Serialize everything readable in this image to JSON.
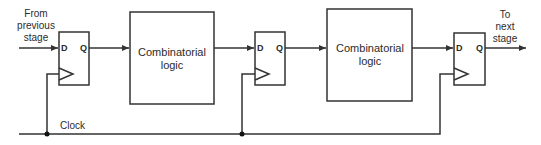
{
  "diagram": {
    "colors": {
      "stroke": "#333333",
      "text": "#2b2b2b",
      "background": "#ffffff"
    },
    "input_label": [
      "From",
      "previous",
      "stage"
    ],
    "output_label": [
      "To",
      "next",
      "stage"
    ],
    "clock_label": "Clock",
    "flip_flops": [
      {
        "id": "ff1",
        "d_label": "D",
        "q_label": "Q"
      },
      {
        "id": "ff2",
        "d_label": "D",
        "q_label": "Q"
      },
      {
        "id": "ff3",
        "d_label": "D",
        "q_label": "Q"
      }
    ],
    "logic_blocks": [
      {
        "id": "logic1",
        "lines": [
          "Combinatorial",
          "logic"
        ]
      },
      {
        "id": "logic2",
        "lines": [
          "Combinatorial",
          "logic"
        ]
      }
    ]
  }
}
